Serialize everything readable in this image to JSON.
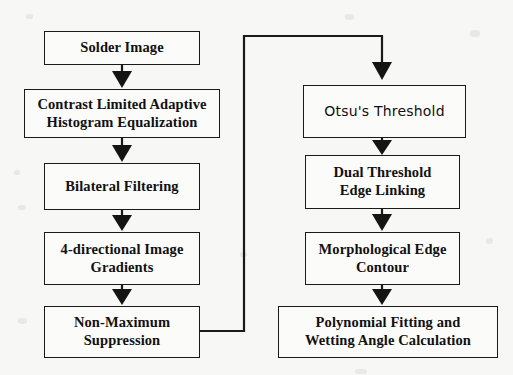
{
  "diagram": {
    "type": "flowchart",
    "orientation": "two-column-vertical",
    "colors": {
      "background": "#f7f7f6",
      "box_fill": "#fbfbfa",
      "stroke": "#1a1a1a",
      "text": "#111111"
    },
    "nodes": [
      {
        "id": "solder",
        "label": "Solder Image",
        "column": "left",
        "order": 1
      },
      {
        "id": "clahe",
        "label": "Contrast Limited Adaptive\nHistogram Equalization",
        "line1": "Contrast Limited Adaptive",
        "line2": "Histogram Equalization",
        "column": "left",
        "order": 2
      },
      {
        "id": "bilateral",
        "label": "Bilateral Filtering",
        "column": "left",
        "order": 3
      },
      {
        "id": "gradients",
        "line1": "4-directional Image",
        "line2": "Gradients",
        "column": "left",
        "order": 4
      },
      {
        "id": "nms",
        "line1": "Non-Maximum",
        "line2": "Suppression",
        "column": "left",
        "order": 5
      },
      {
        "id": "otsu",
        "label": "Otsu's Threshold",
        "column": "right",
        "order": 6
      },
      {
        "id": "dual",
        "line1": "Dual Threshold",
        "line2": "Edge Linking",
        "column": "right",
        "order": 7
      },
      {
        "id": "morph",
        "line1": "Morphological Edge",
        "line2": "Contour",
        "column": "right",
        "order": 8
      },
      {
        "id": "poly",
        "line1": "Polynomial Fitting and",
        "line2": "Wetting Angle Calculation",
        "column": "right",
        "order": 9
      }
    ],
    "edges": [
      {
        "from": "solder",
        "to": "clahe",
        "kind": "straight-down",
        "arrow": true
      },
      {
        "from": "clahe",
        "to": "bilateral",
        "kind": "straight-down",
        "arrow": true
      },
      {
        "from": "bilateral",
        "to": "gradients",
        "kind": "straight-down",
        "arrow": true
      },
      {
        "from": "gradients",
        "to": "nms",
        "kind": "straight-down",
        "arrow": true
      },
      {
        "from": "nms",
        "to": "otsu",
        "kind": "routed-right-up-right-down",
        "arrow": true
      },
      {
        "from": "otsu",
        "to": "dual",
        "kind": "straight-down",
        "arrow": true
      },
      {
        "from": "dual",
        "to": "morph",
        "kind": "straight-down",
        "arrow": true
      },
      {
        "from": "morph",
        "to": "poly",
        "kind": "straight-down",
        "arrow": true
      }
    ]
  }
}
